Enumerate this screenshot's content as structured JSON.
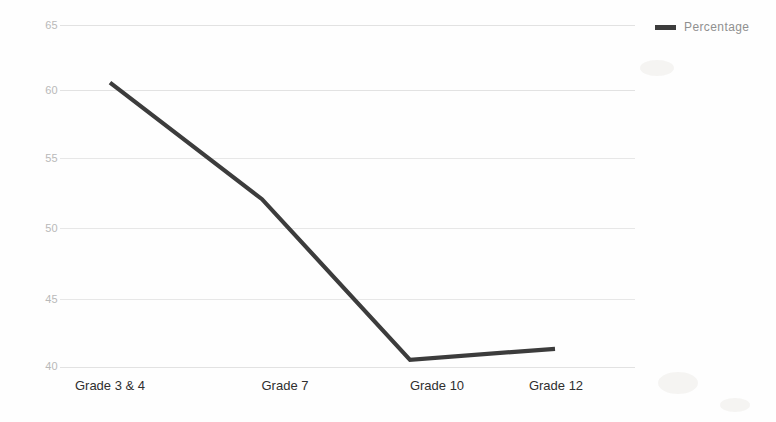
{
  "chart_data": {
    "type": "line",
    "title": "",
    "xlabel": "",
    "ylabel": "",
    "categories": [
      "Grade 3 & 4",
      "Grade 7",
      "Grade 10",
      "Grade 12"
    ],
    "series": [
      {
        "name": "Percentage",
        "values": [
          60.8,
          52.3,
          40.6,
          41.4
        ],
        "color": "#3c3c3c"
      }
    ],
    "ylim": [
      40,
      65
    ],
    "ytick_labels": [
      "65",
      "60",
      "55",
      "50",
      "45",
      "40"
    ],
    "ytick_values": [
      65,
      60,
      55,
      50,
      45,
      40
    ],
    "grid": true,
    "grid_color": "#e2e2e2",
    "legend": {
      "position": "top-right",
      "entries": [
        {
          "label": "Percentage",
          "color": "#3c3c3c",
          "marker": "line-dash-swatch"
        }
      ]
    },
    "background_color": "#fefefe",
    "axis_label_color": "#b9b9b9",
    "category_label_color": "#2f2f2f"
  }
}
